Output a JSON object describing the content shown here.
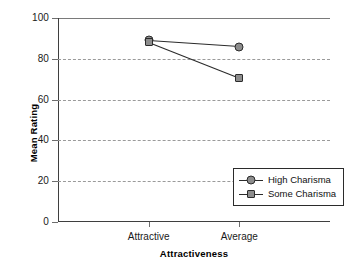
{
  "chart_data": {
    "type": "line",
    "title": "",
    "xlabel": "Attractiveness",
    "ylabel": "Mean Rating",
    "categories": [
      "Attractive",
      "Average"
    ],
    "series": [
      {
        "name": "High Charisma",
        "marker": "circle",
        "values": [
          89,
          86
        ]
      },
      {
        "name": "Some Charisma",
        "marker": "square",
        "values": [
          88,
          70.5
        ]
      }
    ],
    "ylim": [
      0,
      100
    ],
    "yticks": [
      0,
      20,
      40,
      60,
      80,
      100
    ],
    "ytick_labels": [
      "0",
      "20",
      "40",
      "60",
      "80",
      "100"
    ],
    "gridlines": [
      20,
      40,
      60,
      80
    ],
    "grid": true,
    "legend_position": "lower right",
    "colors": {
      "marker_fill": "#8d8d8d",
      "marker_edge": "#2b2b2b",
      "line": "#2b2b2b",
      "grid": "#9a9a9a",
      "axis": "#3f3f3f",
      "background": "#ffffff",
      "text": "#111111"
    }
  },
  "legend": {
    "entries": [
      {
        "label": "High Charisma"
      },
      {
        "label": "Some Charisma"
      }
    ]
  }
}
